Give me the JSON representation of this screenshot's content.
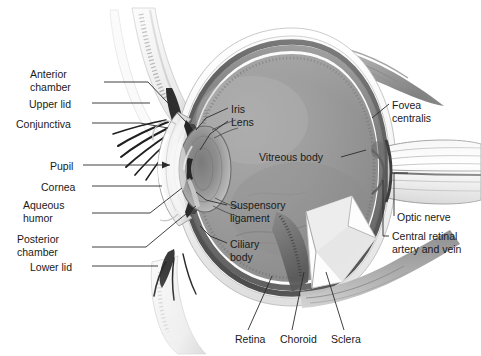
{
  "figure": {
    "background_color": "#ffffff",
    "width": 481,
    "height": 356,
    "style": "grayscale medical illustration",
    "text_color": "#1a1a1a",
    "leader_color": "#2b2b2b"
  },
  "labels": {
    "anterior_chamber": "Anterior\nchamber",
    "upper_lid": "Upper lid",
    "conjunctiva": "Conjunctiva",
    "pupil": "Pupil",
    "cornea": "Cornea",
    "aqueous_humor": "Aqueous\nhumor",
    "posterior_chamber": "Posterior\nchamber",
    "lower_lid": "Lower lid",
    "iris": "Iris",
    "lens": "Lens",
    "vitreous_body": "Vitreous body",
    "suspensory_ligament": "Suspensory\nligament",
    "ciliary_body": "Ciliary\nbody",
    "fovea_centralis": "Fovea\ncentralis",
    "optic_nerve": "Optic nerve",
    "central_retinal_artery_and_vein": "Central retinal\nartery and vein",
    "retina": "Retina",
    "choroid": "Choroid",
    "sclera": "Sclera"
  },
  "label_positions": {
    "anterior_chamber": {
      "x": 30,
      "y": 68,
      "align": "left"
    },
    "upper_lid": {
      "x": 29,
      "y": 98,
      "align": "left"
    },
    "conjunctiva": {
      "x": 16,
      "y": 118,
      "align": "left"
    },
    "pupil": {
      "x": 50,
      "y": 160,
      "align": "left"
    },
    "cornea": {
      "x": 41,
      "y": 182,
      "align": "left"
    },
    "aqueous_humor": {
      "x": 23,
      "y": 199,
      "align": "left"
    },
    "posterior_chamber": {
      "x": 17,
      "y": 233,
      "align": "left"
    },
    "lower_lid": {
      "x": 30,
      "y": 262,
      "align": "left"
    },
    "iris": {
      "x": 231,
      "y": 104,
      "align": "left"
    },
    "lens": {
      "x": 231,
      "y": 117,
      "align": "left"
    },
    "vitreous_body": {
      "x": 259,
      "y": 152,
      "align": "left"
    },
    "suspensory_ligament": {
      "x": 230,
      "y": 199,
      "align": "left"
    },
    "ciliary_body": {
      "x": 230,
      "y": 239,
      "align": "left"
    },
    "fovea_centralis": {
      "x": 392,
      "y": 99,
      "align": "left"
    },
    "optic_nerve": {
      "x": 397,
      "y": 212,
      "align": "left"
    },
    "central_retinal_artery_and_vein": {
      "x": 392,
      "y": 231,
      "align": "left"
    },
    "retina": {
      "x": 235,
      "y": 334,
      "align": "left"
    },
    "choroid": {
      "x": 280,
      "y": 334,
      "align": "left"
    },
    "sclera": {
      "x": 331,
      "y": 334,
      "align": "left"
    }
  },
  "structures": [
    "upper eyelid",
    "lower eyelid",
    "eyelashes",
    "conjunctiva",
    "cornea",
    "anterior chamber",
    "posterior chamber",
    "aqueous humor",
    "pupil",
    "iris",
    "lens",
    "suspensory ligament",
    "ciliary body",
    "vitreous body",
    "retina",
    "choroid",
    "sclera",
    "fovea centralis",
    "optic nerve",
    "central retinal artery and vein",
    "superior rectus muscle",
    "inferior rectus muscle"
  ]
}
